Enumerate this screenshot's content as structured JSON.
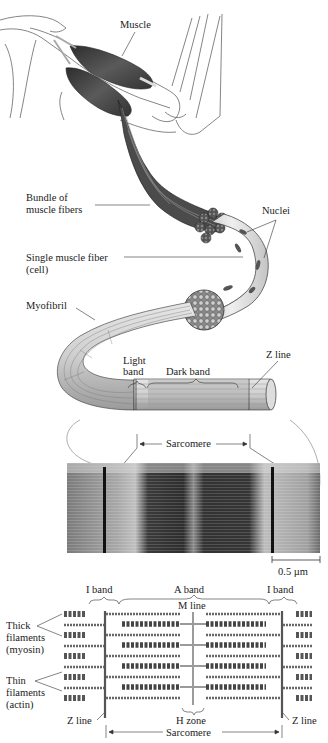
{
  "figure": {
    "type": "anatomical-diagram"
  },
  "labels": {
    "muscle": "Muscle",
    "nuclei": "Nuclei",
    "bundle_line1": "Bundle of",
    "bundle_line2": "muscle fibers",
    "fiber_line1": "Single muscle fiber",
    "fiber_line2": "(cell)",
    "myofibril": "Myofibril",
    "light_band_line1": "Light",
    "light_band_line2": "band",
    "dark_band": "Dark band",
    "z_line_top": "Z line",
    "sarcomere_top": "Sarcomere",
    "scale_bar": "0.5 µm",
    "i_band_left": "I band",
    "a_band": "A band",
    "i_band_right": "I band",
    "m_line": "M line",
    "thick_line1": "Thick",
    "thick_line2": "filaments",
    "thick_line3": "(myosin)",
    "thin_line1": "Thin",
    "thin_line2": "filaments",
    "thin_line3": "(actin)",
    "z_line_left": "Z line",
    "h_zone": "H zone",
    "z_line_right": "Z line",
    "sarcomere_bottom": "Sarcomere"
  },
  "colors": {
    "muscle_dark": "#3a3a3a",
    "muscle_mid": "#6b6b6b",
    "fiber_light": "#d9d9d9",
    "outline": "#333333",
    "skin_line": "#555555",
    "micrograph_dark": "#2e2e2e",
    "micrograph_light": "#bdbdbd"
  }
}
